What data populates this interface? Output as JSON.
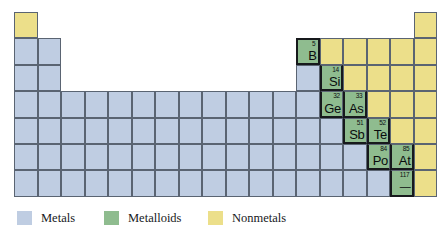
{
  "figure": {
    "kind": "periodic-table-classification-diagram",
    "width": 442,
    "height": 236,
    "background": "#ffffff"
  },
  "colors": {
    "metal": "#bfcde2",
    "metalloid": "#8fbc8f",
    "nonmetal": "#ecdf8a",
    "cell_border": "#5a6472",
    "staircase_border": "#17191c",
    "text": "#0a0c0e"
  },
  "grid": {
    "columns": 18,
    "rows": 7,
    "cell_width": 23.5,
    "cell_height": 26.4,
    "origin_x": 14,
    "origin_y": 12
  },
  "legend": {
    "items": [
      {
        "id": "metals",
        "label": "Metals",
        "color": "#bfcde2"
      },
      {
        "id": "metalloids",
        "label": "Metalloids",
        "color": "#8fbc8f"
      },
      {
        "id": "nonmetals",
        "label": "Nonmetals",
        "color": "#ecdf8a"
      }
    ]
  },
  "labeled_elements": [
    {
      "number": "5",
      "symbol": "B",
      "category": "metalloid",
      "row": 2,
      "col": 13
    },
    {
      "number": "14",
      "symbol": "Si",
      "category": "metalloid",
      "row": 3,
      "col": 14
    },
    {
      "number": "32",
      "symbol": "Ge",
      "category": "metalloid",
      "row": 4,
      "col": 14
    },
    {
      "number": "33",
      "symbol": "As",
      "category": "metalloid",
      "row": 4,
      "col": 15
    },
    {
      "number": "51",
      "symbol": "Sb",
      "category": "metalloid",
      "row": 5,
      "col": 15
    },
    {
      "number": "52",
      "symbol": "Te",
      "category": "metalloid",
      "row": 5,
      "col": 16
    },
    {
      "number": "84",
      "symbol": "Po",
      "category": "metalloid",
      "row": 6,
      "col": 16
    },
    {
      "number": "85",
      "symbol": "At",
      "category": "metalloid",
      "row": 6,
      "col": 17
    },
    {
      "number": "117",
      "symbol": "—",
      "category": "metalloid",
      "row": 7,
      "col": 17
    }
  ],
  "cells": [
    {
      "row": 1,
      "col": 1,
      "category": "nonmetal"
    },
    {
      "row": 1,
      "col": 18,
      "category": "nonmetal"
    },
    {
      "row": 2,
      "col": 1,
      "category": "metal"
    },
    {
      "row": 2,
      "col": 2,
      "category": "metal"
    },
    {
      "row": 2,
      "col": 13,
      "category": "metalloid",
      "number": "5",
      "symbol": "B",
      "edges": [
        "top",
        "left",
        "right",
        "bottom"
      ]
    },
    {
      "row": 2,
      "col": 14,
      "category": "nonmetal"
    },
    {
      "row": 2,
      "col": 15,
      "category": "nonmetal"
    },
    {
      "row": 2,
      "col": 16,
      "category": "nonmetal"
    },
    {
      "row": 2,
      "col": 17,
      "category": "nonmetal"
    },
    {
      "row": 2,
      "col": 18,
      "category": "nonmetal"
    },
    {
      "row": 3,
      "col": 1,
      "category": "metal"
    },
    {
      "row": 3,
      "col": 2,
      "category": "metal"
    },
    {
      "row": 3,
      "col": 13,
      "category": "metal"
    },
    {
      "row": 3,
      "col": 14,
      "category": "metalloid",
      "number": "14",
      "symbol": "Si",
      "edges": [
        "left",
        "right",
        "bottom"
      ]
    },
    {
      "row": 3,
      "col": 15,
      "category": "nonmetal"
    },
    {
      "row": 3,
      "col": 16,
      "category": "nonmetal"
    },
    {
      "row": 3,
      "col": 17,
      "category": "nonmetal"
    },
    {
      "row": 3,
      "col": 18,
      "category": "nonmetal"
    },
    {
      "row": 4,
      "col": 1,
      "category": "metal"
    },
    {
      "row": 4,
      "col": 2,
      "category": "metal"
    },
    {
      "row": 4,
      "col": 3,
      "category": "metal"
    },
    {
      "row": 4,
      "col": 4,
      "category": "metal"
    },
    {
      "row": 4,
      "col": 5,
      "category": "metal"
    },
    {
      "row": 4,
      "col": 6,
      "category": "metal"
    },
    {
      "row": 4,
      "col": 7,
      "category": "metal"
    },
    {
      "row": 4,
      "col": 8,
      "category": "metal"
    },
    {
      "row": 4,
      "col": 9,
      "category": "metal"
    },
    {
      "row": 4,
      "col": 10,
      "category": "metal"
    },
    {
      "row": 4,
      "col": 11,
      "category": "metal"
    },
    {
      "row": 4,
      "col": 12,
      "category": "metal"
    },
    {
      "row": 4,
      "col": 13,
      "category": "metal"
    },
    {
      "row": 4,
      "col": 14,
      "category": "metalloid",
      "number": "32",
      "symbol": "Ge",
      "edges": [
        "left",
        "bottom"
      ]
    },
    {
      "row": 4,
      "col": 15,
      "category": "metalloid",
      "number": "33",
      "symbol": "As",
      "edges": [
        "left",
        "right",
        "bottom"
      ]
    },
    {
      "row": 4,
      "col": 16,
      "category": "nonmetal"
    },
    {
      "row": 4,
      "col": 17,
      "category": "nonmetal"
    },
    {
      "row": 4,
      "col": 18,
      "category": "nonmetal"
    },
    {
      "row": 5,
      "col": 1,
      "category": "metal"
    },
    {
      "row": 5,
      "col": 2,
      "category": "metal"
    },
    {
      "row": 5,
      "col": 3,
      "category": "metal"
    },
    {
      "row": 5,
      "col": 4,
      "category": "metal"
    },
    {
      "row": 5,
      "col": 5,
      "category": "metal"
    },
    {
      "row": 5,
      "col": 6,
      "category": "metal"
    },
    {
      "row": 5,
      "col": 7,
      "category": "metal"
    },
    {
      "row": 5,
      "col": 8,
      "category": "metal"
    },
    {
      "row": 5,
      "col": 9,
      "category": "metal"
    },
    {
      "row": 5,
      "col": 10,
      "category": "metal"
    },
    {
      "row": 5,
      "col": 11,
      "category": "metal"
    },
    {
      "row": 5,
      "col": 12,
      "category": "metal"
    },
    {
      "row": 5,
      "col": 13,
      "category": "metal"
    },
    {
      "row": 5,
      "col": 14,
      "category": "metal"
    },
    {
      "row": 5,
      "col": 15,
      "category": "metalloid",
      "number": "51",
      "symbol": "Sb",
      "edges": [
        "left",
        "bottom"
      ]
    },
    {
      "row": 5,
      "col": 16,
      "category": "metalloid",
      "number": "52",
      "symbol": "Te",
      "edges": [
        "left",
        "right",
        "bottom"
      ]
    },
    {
      "row": 5,
      "col": 17,
      "category": "nonmetal"
    },
    {
      "row": 5,
      "col": 18,
      "category": "nonmetal"
    },
    {
      "row": 6,
      "col": 1,
      "category": "metal"
    },
    {
      "row": 6,
      "col": 2,
      "category": "metal"
    },
    {
      "row": 6,
      "col": 3,
      "category": "metal"
    },
    {
      "row": 6,
      "col": 4,
      "category": "metal"
    },
    {
      "row": 6,
      "col": 5,
      "category": "metal"
    },
    {
      "row": 6,
      "col": 6,
      "category": "metal"
    },
    {
      "row": 6,
      "col": 7,
      "category": "metal"
    },
    {
      "row": 6,
      "col": 8,
      "category": "metal"
    },
    {
      "row": 6,
      "col": 9,
      "category": "metal"
    },
    {
      "row": 6,
      "col": 10,
      "category": "metal"
    },
    {
      "row": 6,
      "col": 11,
      "category": "metal"
    },
    {
      "row": 6,
      "col": 12,
      "category": "metal"
    },
    {
      "row": 6,
      "col": 13,
      "category": "metal"
    },
    {
      "row": 6,
      "col": 14,
      "category": "metal"
    },
    {
      "row": 6,
      "col": 15,
      "category": "metal"
    },
    {
      "row": 6,
      "col": 16,
      "category": "metalloid",
      "number": "84",
      "symbol": "Po",
      "edges": [
        "left",
        "bottom"
      ]
    },
    {
      "row": 6,
      "col": 17,
      "category": "metalloid",
      "number": "85",
      "symbol": "At",
      "edges": [
        "left",
        "right",
        "bottom"
      ]
    },
    {
      "row": 6,
      "col": 18,
      "category": "nonmetal"
    },
    {
      "row": 7,
      "col": 1,
      "category": "metal"
    },
    {
      "row": 7,
      "col": 2,
      "category": "metal"
    },
    {
      "row": 7,
      "col": 3,
      "category": "metal"
    },
    {
      "row": 7,
      "col": 4,
      "category": "metal"
    },
    {
      "row": 7,
      "col": 5,
      "category": "metal"
    },
    {
      "row": 7,
      "col": 6,
      "category": "metal"
    },
    {
      "row": 7,
      "col": 7,
      "category": "metal"
    },
    {
      "row": 7,
      "col": 8,
      "category": "metal"
    },
    {
      "row": 7,
      "col": 9,
      "category": "metal"
    },
    {
      "row": 7,
      "col": 10,
      "category": "metal"
    },
    {
      "row": 7,
      "col": 11,
      "category": "metal"
    },
    {
      "row": 7,
      "col": 12,
      "category": "metal"
    },
    {
      "row": 7,
      "col": 13,
      "category": "metal"
    },
    {
      "row": 7,
      "col": 14,
      "category": "metal"
    },
    {
      "row": 7,
      "col": 15,
      "category": "metal"
    },
    {
      "row": 7,
      "col": 16,
      "category": "metal"
    },
    {
      "row": 7,
      "col": 17,
      "category": "metalloid",
      "number": "117",
      "symbol": "—",
      "edges": [
        "left",
        "right",
        "bottom"
      ]
    },
    {
      "row": 7,
      "col": 18,
      "category": "nonmetal"
    }
  ]
}
